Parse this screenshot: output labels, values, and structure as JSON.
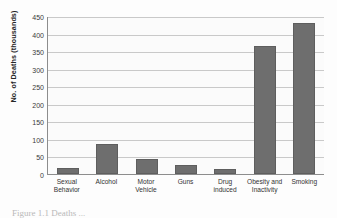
{
  "chart_data": {
    "type": "bar",
    "title": "",
    "xlabel": "",
    "ylabel": "No. of Deaths (thousands)",
    "categories": [
      "Sexual Behavior",
      "Alcohol",
      "Motor Vehicle",
      "Guns",
      "Drug induced",
      "Obesity and Inactivity",
      "Smoking"
    ],
    "values": [
      18,
      85,
      42,
      25,
      13,
      365,
      430
    ],
    "ylim": [
      0,
      450
    ],
    "ytick_labels": [
      "450",
      "400",
      "350",
      "300",
      "250",
      "200",
      "150",
      "100",
      "50",
      "0"
    ],
    "ytick_values": [
      450,
      400,
      350,
      300,
      250,
      200,
      150,
      100,
      50,
      0
    ],
    "ytick_step": 50,
    "grid": true,
    "legend": "none",
    "bar_color": "#6e6e6e",
    "plot_background": "#fbfbfb",
    "gridline_color": "#c9c9c9",
    "axis_color": "#8d8d8d"
  },
  "caption": {
    "text": "Figure 1.1  Deaths ..."
  }
}
